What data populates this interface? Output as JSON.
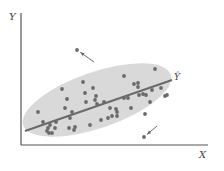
{
  "chart_data": {
    "type": "scatter",
    "title": "",
    "xlabel": "X",
    "ylabel": "Y",
    "regression_label": "Ŷ",
    "grid": false,
    "legend": null,
    "colors": {
      "points": "#6a6a6a",
      "ellipse": "#d9d9d9",
      "line": "#6a6a6a",
      "axes": "#555555"
    },
    "note": "Unlabeled axes; coordinates in pixel space of the figure (x right, y down)",
    "ellipse": {
      "cx": 97,
      "cy": 100,
      "rx": 78,
      "ry": 28,
      "rotate_deg": -19
    },
    "regression_line": {
      "x1": 25,
      "y1": 131,
      "x2": 172,
      "y2": 80
    },
    "points": [
      [
        38,
        112
      ],
      [
        43,
        122
      ],
      [
        47,
        131
      ],
      [
        48,
        128
      ],
      [
        50,
        125
      ],
      [
        49,
        133
      ],
      [
        52,
        133
      ],
      [
        55,
        128
      ],
      [
        56,
        122
      ],
      [
        62,
        89
      ],
      [
        65,
        108
      ],
      [
        67,
        99
      ],
      [
        69,
        128
      ],
      [
        70,
        118
      ],
      [
        72,
        112
      ],
      [
        74,
        130
      ],
      [
        75,
        127
      ],
      [
        83,
        82
      ],
      [
        85,
        93
      ],
      [
        86,
        102
      ],
      [
        90,
        125
      ],
      [
        93,
        88
      ],
      [
        95,
        100
      ],
      [
        96,
        96
      ],
      [
        97,
        104
      ],
      [
        101,
        120
      ],
      [
        104,
        102
      ],
      [
        108,
        118
      ],
      [
        110,
        108
      ],
      [
        112,
        116
      ],
      [
        116,
        109
      ],
      [
        117,
        116
      ],
      [
        117,
        112
      ],
      [
        124,
        76
      ],
      [
        124,
        98
      ],
      [
        128,
        98
      ],
      [
        131,
        108
      ],
      [
        134,
        84
      ],
      [
        138,
        83
      ],
      [
        138,
        87
      ],
      [
        139,
        95
      ],
      [
        143,
        94
      ],
      [
        145,
        114
      ],
      [
        146,
        95
      ],
      [
        150,
        102
      ],
      [
        152,
        90
      ],
      [
        155,
        69
      ],
      [
        161,
        88
      ],
      [
        165,
        96
      ],
      [
        167,
        95
      ]
    ],
    "outliers": [
      {
        "x": 77,
        "y": 50,
        "arrow_from": [
          94,
          62
        ]
      },
      {
        "x": 144,
        "y": 137,
        "arrow_from": [
          157,
          126
        ]
      }
    ]
  }
}
